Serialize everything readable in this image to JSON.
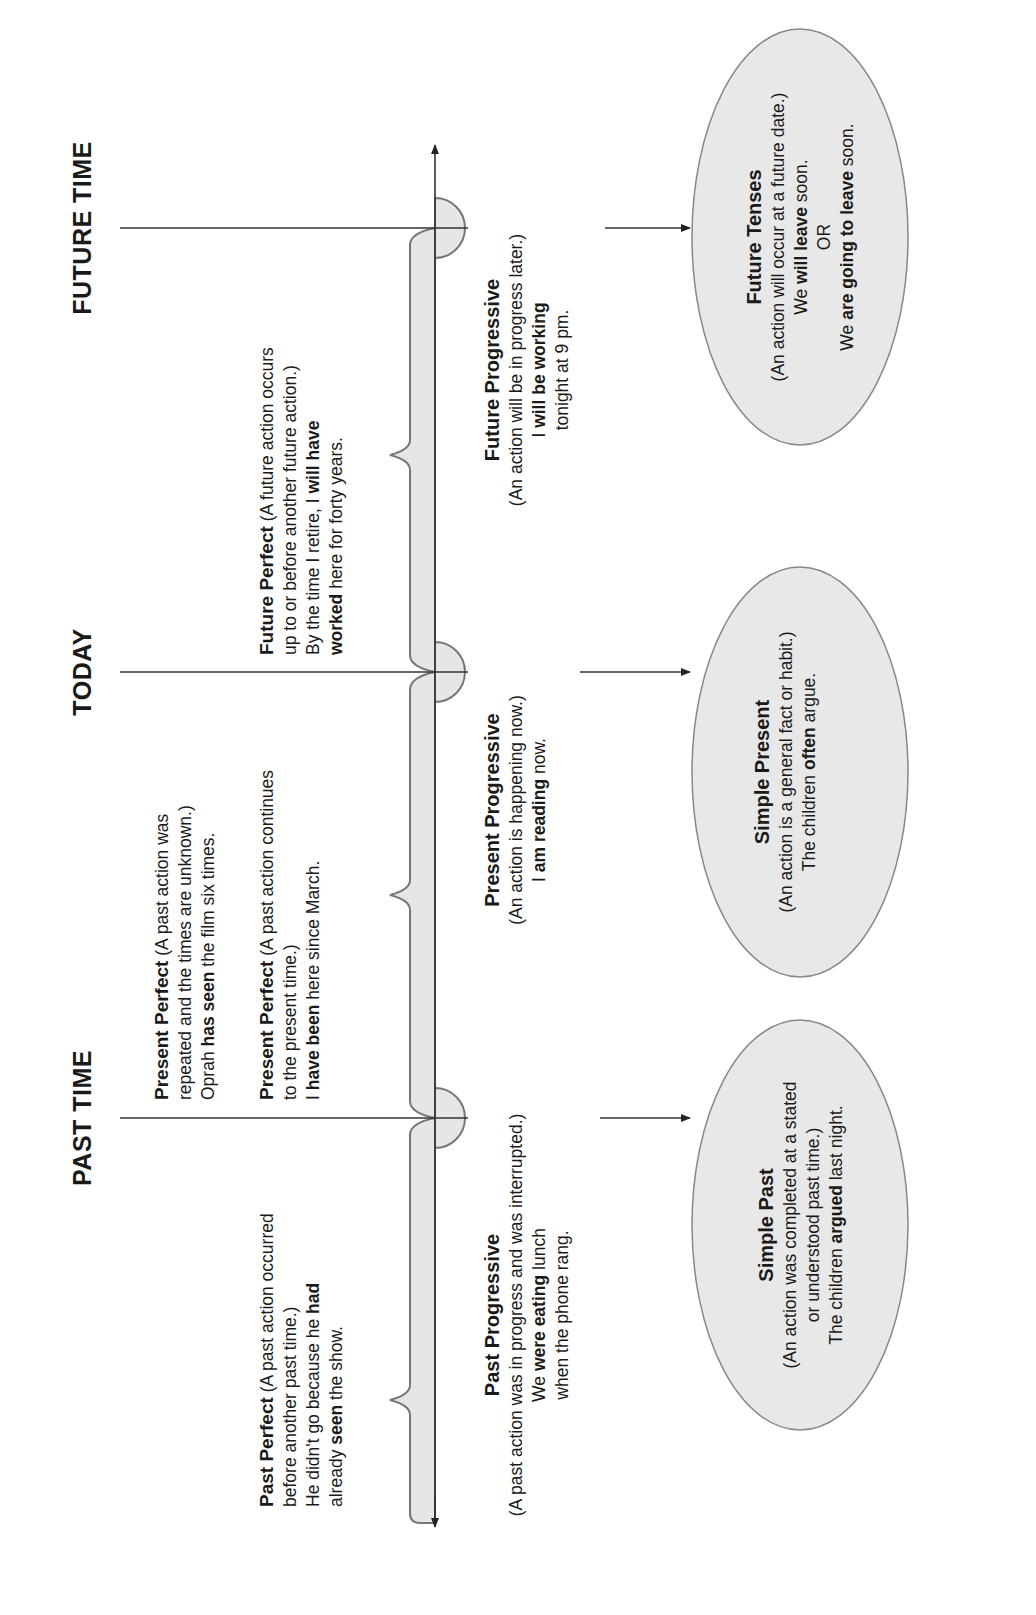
{
  "eras": {
    "past": "PAST TIME",
    "today": "TODAY",
    "future": "FUTURE TIME"
  },
  "perfect": {
    "past_perfect": {
      "title": "Past Perfect",
      "def1": " (A past action occurred",
      "def2": "before another past time.)",
      "ex_a": "He didn't go because he ",
      "ex_b": "had",
      "ex_c": "already ",
      "ex_d": "seen",
      "ex_e": " the show."
    },
    "present_perfect_repeated": {
      "title": "Present Perfect",
      "def1": " (A past action was",
      "def2": "repeated and the times are unknown.)",
      "ex_a": "Oprah ",
      "ex_b": "has seen",
      "ex_c": " the film six times."
    },
    "present_perfect_continues": {
      "title": "Present Perfect",
      "def1": " (A past action continues",
      "def2": "to the present time.)",
      "ex_a": "I ",
      "ex_b": "have been",
      "ex_c": " here since March."
    },
    "future_perfect": {
      "title": "Future Perfect",
      "def1": " (A future action occurs",
      "def2": "up to or before another future action.)",
      "ex_a": "By the time I retire, I ",
      "ex_b": "will have",
      "ex_c": "worked",
      "ex_d": " here for forty years."
    }
  },
  "progressive": {
    "past": {
      "title": "Past Progressive",
      "def": "(A past action was in progress and was interrupted.)",
      "ex_a": "We ",
      "ex_b": "were eating",
      "ex_c": " lunch",
      "ex_d": "when the phone rang."
    },
    "present": {
      "title": "Present Progressive",
      "def": "(An action is happening now.)",
      "ex_a": "I ",
      "ex_b": "am reading",
      "ex_c": " now."
    },
    "future": {
      "title": "Future Progressive",
      "def": "(An action will be in progress later.)",
      "ex_a": "I ",
      "ex_b": "will be working",
      "ex_c": "tonight at 9 pm."
    }
  },
  "simple": {
    "past": {
      "title": "Simple Past",
      "def1": "(An action was completed at a stated",
      "def2": "or understood past time.)",
      "ex_a": "The children ",
      "ex_b": "argued",
      "ex_c": " last night."
    },
    "present": {
      "title": "Simple Present",
      "def": "(An action is a general fact or habit.)",
      "ex_a": "The children ",
      "ex_b": "often",
      "ex_c": " argue."
    },
    "future": {
      "title": "Future Tenses",
      "def": "(An action will occur at a future date.)",
      "ex1_a": "We ",
      "ex1_b": "will leave",
      "ex1_c": " soon.",
      "or": "OR",
      "ex2_a": "We ",
      "ex2_b": "are going to leave",
      "ex2_c": " soon."
    }
  },
  "colors": {
    "line": "#333333",
    "shape_fill": "#e6e6e6",
    "shape_stroke": "#777777",
    "ellipse_fill": "#e8e8e8"
  }
}
